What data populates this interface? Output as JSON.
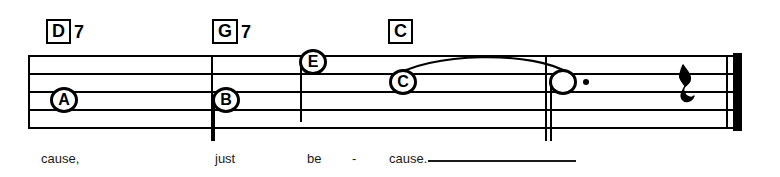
{
  "score": {
    "chords": [
      {
        "name": "chord-d7",
        "root": "D",
        "extension": "7",
        "x": 46,
        "y": 19
      },
      {
        "name": "chord-g7",
        "root": "G",
        "extension": "7",
        "x": 212,
        "y": 19
      },
      {
        "name": "chord-c",
        "root": "C",
        "extension": "",
        "x": 388,
        "y": 19
      }
    ],
    "notes": [
      {
        "name": "note-a",
        "label": "A",
        "x": 50,
        "y": 87,
        "stem": "none",
        "dotted": false,
        "filled": false
      },
      {
        "name": "note-b",
        "label": "B",
        "x": 212,
        "y": 87,
        "stem": "down",
        "dotted": false,
        "filled": false
      },
      {
        "name": "note-e",
        "label": "E",
        "x": 299,
        "y": 49,
        "stem": "down",
        "dotted": false,
        "filled": false
      },
      {
        "name": "note-c",
        "label": "C",
        "x": 389,
        "y": 69,
        "stem": "none",
        "dotted": false,
        "filled": false
      },
      {
        "name": "note-tied",
        "label": "",
        "x": 549,
        "y": 69,
        "stem": "down",
        "dotted": true,
        "filled": false
      }
    ],
    "rest": {
      "name": "quarter-rest",
      "glyph": "𝄽",
      "x": 677,
      "y": 62
    },
    "lyrics": [
      {
        "name": "lyric-cause-1",
        "text": "cause,",
        "x": 41,
        "y": 152
      },
      {
        "name": "lyric-just",
        "text": "just",
        "x": 215,
        "y": 152
      },
      {
        "name": "lyric-be",
        "text": "be",
        "x": 307,
        "y": 152
      },
      {
        "name": "lyric-hyphen",
        "text": "-",
        "x": 352,
        "y": 152
      },
      {
        "name": "lyric-cause-2",
        "text": "cause.",
        "x": 389,
        "y": 152
      }
    ],
    "barlines": [
      {
        "name": "barline-1",
        "x": 211
      },
      {
        "name": "barline-2",
        "x": 545
      }
    ],
    "staff": {
      "left": 28,
      "right": 742,
      "top": 55,
      "line_gap": 18,
      "line_count": 5
    },
    "colors": {
      "ink": "#000000",
      "lyric_ink": "#1a1a1a",
      "paper": "#ffffff"
    }
  }
}
